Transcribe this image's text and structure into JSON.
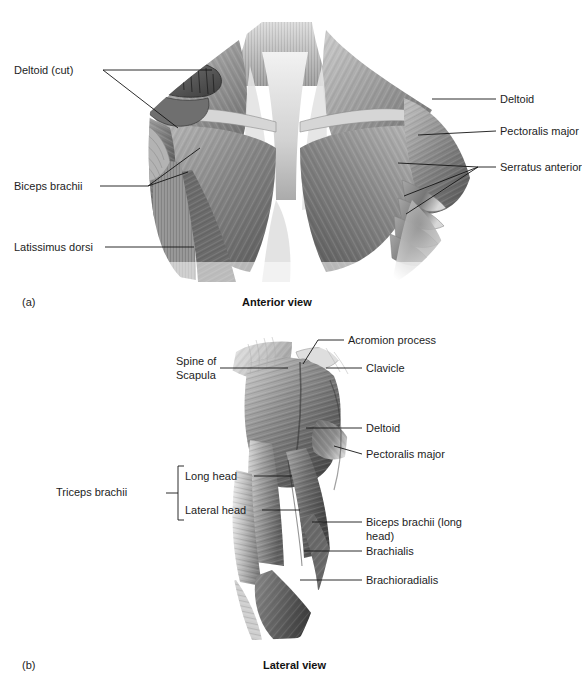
{
  "figure": {
    "title_hidden": "",
    "panels": [
      {
        "letter": "(a)",
        "caption": "Anterior view",
        "view": "anterior-shoulder-chest",
        "labels": [
          {
            "id": "deltoid-cut",
            "text": "Deltoid (cut)",
            "align": "right",
            "x": 14,
            "y": 64
          },
          {
            "id": "biceps-brachii",
            "text": "Biceps brachii",
            "align": "right",
            "x": 14,
            "y": 180
          },
          {
            "id": "latissimus-dorsi",
            "text": "Latissimus dorsi",
            "align": "right",
            "x": 14,
            "y": 241
          },
          {
            "id": "deltoid",
            "text": "Deltoid",
            "align": "left",
            "x": 500,
            "y": 93
          },
          {
            "id": "pectoralis-major",
            "text": "Pectoralis major",
            "align": "left",
            "x": 500,
            "y": 125
          },
          {
            "id": "serratus-anterior",
            "text": "Serratus anterior",
            "align": "left",
            "x": 500,
            "y": 161
          }
        ]
      },
      {
        "letter": "(b)",
        "caption": "Lateral view",
        "view": "lateral-arm-shoulder",
        "labels": [
          {
            "id": "acromion-process",
            "text": "Acromion process",
            "align": "left",
            "x": 348,
            "y": 334
          },
          {
            "id": "spine-of-scapula",
            "text": "Spine of\nScapula",
            "align": "right",
            "x": 176,
            "y": 355
          },
          {
            "id": "clavicle",
            "text": "Clavicle",
            "align": "left",
            "x": 366,
            "y": 362
          },
          {
            "id": "deltoid-b",
            "text": "Deltoid",
            "align": "left",
            "x": 366,
            "y": 422
          },
          {
            "id": "pectoralis-major-b",
            "text": "Pectoralis major",
            "align": "left",
            "x": 366,
            "y": 448
          },
          {
            "id": "triceps-brachii",
            "text": "Triceps brachii",
            "align": "right",
            "x": 56,
            "y": 486
          },
          {
            "id": "long-head",
            "text": "Long head",
            "align": "right",
            "x": 185,
            "y": 470
          },
          {
            "id": "lateral-head",
            "text": "Lateral head",
            "align": "right",
            "x": 185,
            "y": 504
          },
          {
            "id": "biceps-brachii-long-head",
            "text": "Biceps brachii\n(long head)",
            "align": "left",
            "x": 366,
            "y": 516
          },
          {
            "id": "brachialis",
            "text": "Brachialis",
            "align": "left",
            "x": 366,
            "y": 545
          },
          {
            "id": "brachioradialis",
            "text": "Brachioradialis",
            "align": "left",
            "x": 366,
            "y": 574
          }
        ]
      }
    ],
    "colors": {
      "text": "#1d1d1d",
      "leader": "#141414",
      "background": "#ffffff",
      "muscle_dark": "#4a4a4a",
      "muscle_mid": "#8c8c8c",
      "muscle_light": "#cfcfcf"
    }
  }
}
